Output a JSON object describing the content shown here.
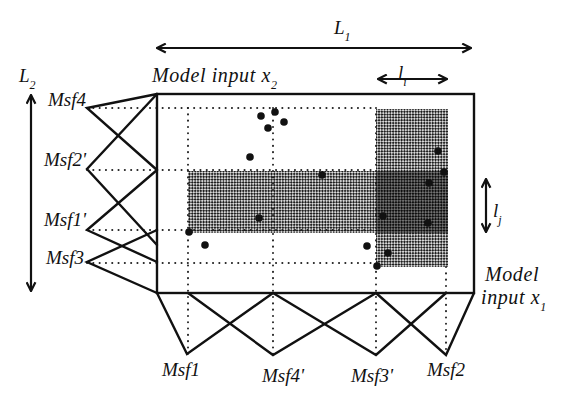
{
  "diagram": {
    "labels": {
      "L1": {
        "main": "L",
        "sub": "1"
      },
      "L2": {
        "main": "L",
        "sub": "2"
      },
      "li": {
        "main": "l",
        "sub": "i"
      },
      "lj": {
        "main": "l",
        "sub": "j"
      },
      "x2_axis": {
        "main": "Model input x",
        "sub": "2"
      },
      "x1_axis_line1": "Model",
      "x1_axis_line2": {
        "main": "input x",
        "sub": "1"
      }
    },
    "colors": {
      "line": "#111111",
      "shade_light": "#808080",
      "shade_dark": "#444444",
      "background": "#ffffff"
    },
    "x2_membership_functions": [
      {
        "label": "Msf4",
        "vertex": [
          87,
          108
        ],
        "ends": [
          [
            157,
            94
          ],
          [
            157,
            170
          ]
        ],
        "label_pos": [
          86,
          106
        ]
      },
      {
        "label": "Msf2'",
        "vertex": [
          87,
          169
        ],
        "ends": [
          [
            157,
            94
          ],
          [
            157,
            245
          ]
        ],
        "label_pos": [
          86,
          166
        ]
      },
      {
        "label": "Msf1'",
        "vertex": [
          87,
          230
        ],
        "ends": [
          [
            157,
            170
          ],
          [
            157,
            262
          ]
        ],
        "label_pos": [
          86,
          226
        ]
      },
      {
        "label": "Msf3",
        "vertex": [
          87,
          262
        ],
        "ends": [
          [
            157,
            230
          ],
          [
            157,
            293
          ]
        ],
        "label_pos": [
          84,
          264
        ]
      }
    ],
    "x1_membership_functions": [
      {
        "label": "Msf1",
        "vertex": [
          187,
          354
        ],
        "ends": [
          [
            157,
            293
          ],
          [
            273,
            293
          ]
        ],
        "label_pos": [
          181,
          376
        ]
      },
      {
        "label": "Msf4'",
        "vertex": [
          273,
          355
        ],
        "ends": [
          [
            188,
            293
          ],
          [
            376,
            293
          ]
        ],
        "label_pos": [
          283,
          382
        ]
      },
      {
        "label": "Msf3'",
        "vertex": [
          376,
          355
        ],
        "ends": [
          [
            273,
            293
          ],
          [
            446,
            293
          ]
        ],
        "label_pos": [
          372,
          382
        ]
      },
      {
        "label": "Msf2",
        "vertex": [
          446,
          355
        ],
        "ends": [
          [
            376,
            293
          ],
          [
            474,
            293
          ]
        ],
        "label_pos": [
          446,
          376
        ]
      }
    ],
    "guides": {
      "horizontal": [
        {
          "y": 108,
          "x1": 87,
          "x2": 376
        },
        {
          "y": 170,
          "x1": 87,
          "x2": 376
        },
        {
          "y": 230,
          "x1": 87,
          "x2": 376
        },
        {
          "y": 263,
          "x1": 87,
          "x2": 377
        }
      ],
      "vertical": [
        {
          "x": 188,
          "y1": 108,
          "y2": 354
        },
        {
          "x": 273,
          "y1": 108,
          "y2": 355
        },
        {
          "x": 376,
          "y1": 108,
          "y2": 355
        },
        {
          "x": 446,
          "y1": 267,
          "y2": 355
        }
      ]
    },
    "shaded_regions": [
      {
        "name": "rule-band-x2",
        "x": 188,
        "y": 171,
        "w": 260,
        "h": 62,
        "tone": "light"
      },
      {
        "name": "rule-band-x1",
        "x": 376,
        "y": 109,
        "w": 72,
        "h": 158,
        "tone": "light"
      },
      {
        "name": "rule-overlap",
        "x": 376,
        "y": 171,
        "w": 72,
        "h": 62,
        "tone": "dark"
      }
    ],
    "data_points": [
      [
        261,
        116
      ],
      [
        275,
        112
      ],
      [
        284,
        122
      ],
      [
        268,
        128
      ],
      [
        250,
        157
      ],
      [
        322,
        175
      ],
      [
        438,
        151
      ],
      [
        444,
        172
      ],
      [
        429,
        183
      ],
      [
        383,
        216
      ],
      [
        428,
        223
      ],
      [
        259,
        218
      ],
      [
        189,
        232
      ],
      [
        205,
        245
      ],
      [
        367,
        246
      ],
      [
        388,
        253
      ],
      [
        377,
        266
      ]
    ]
  }
}
